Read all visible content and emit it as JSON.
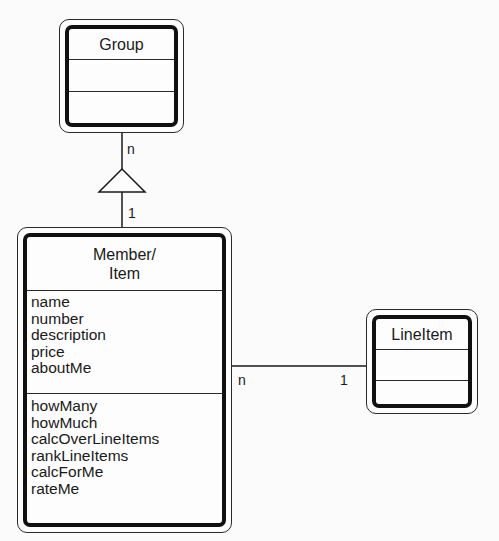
{
  "diagram": {
    "type": "UML class diagram",
    "classes": {
      "group": {
        "name": "Group",
        "attributes": [],
        "operations": []
      },
      "member_item": {
        "name_line1": "Member/",
        "name_line2": "Item",
        "attributes": [
          "name",
          "number",
          "description",
          "price",
          "aboutMe"
        ],
        "operations": [
          "howMany",
          "howMuch",
          "calcOverLineItems",
          "rankLineItems",
          "calcForMe",
          "rateMe"
        ]
      },
      "line_item": {
        "name": "LineItem",
        "attributes": [],
        "operations": []
      }
    },
    "relationships": {
      "group_member": {
        "kind": "inheritance-triangle",
        "group_end_multiplicity": "n",
        "member_end_multiplicity": "1"
      },
      "member_lineitem": {
        "kind": "association",
        "member_end_multiplicity": "n",
        "lineitem_end_multiplicity": "1"
      }
    },
    "colors": {
      "line": "#1a1a1a",
      "background": "#fbfbfb"
    }
  }
}
